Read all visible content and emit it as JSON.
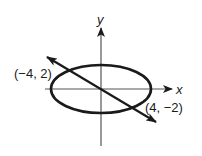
{
  "diagram": {
    "type": "coordinate-graph",
    "axes": {
      "x_label": "x",
      "y_label": "y"
    },
    "ellipse": {
      "center": [
        0,
        0
      ],
      "shape": "horizontal ellipse"
    },
    "line": {
      "through": [
        [
          -4,
          2
        ],
        [
          4,
          -2
        ]
      ],
      "direction": "negative slope, arrows at both ends"
    },
    "intersection_points": [
      {
        "label": "(−4, 2)",
        "coords": [
          -4,
          2
        ]
      },
      {
        "label": "(4, −2)",
        "coords": [
          4,
          -2
        ]
      }
    ],
    "colors": {
      "stroke": "#1a1a1a",
      "axis": "#555555",
      "background": "#ffffff"
    }
  }
}
